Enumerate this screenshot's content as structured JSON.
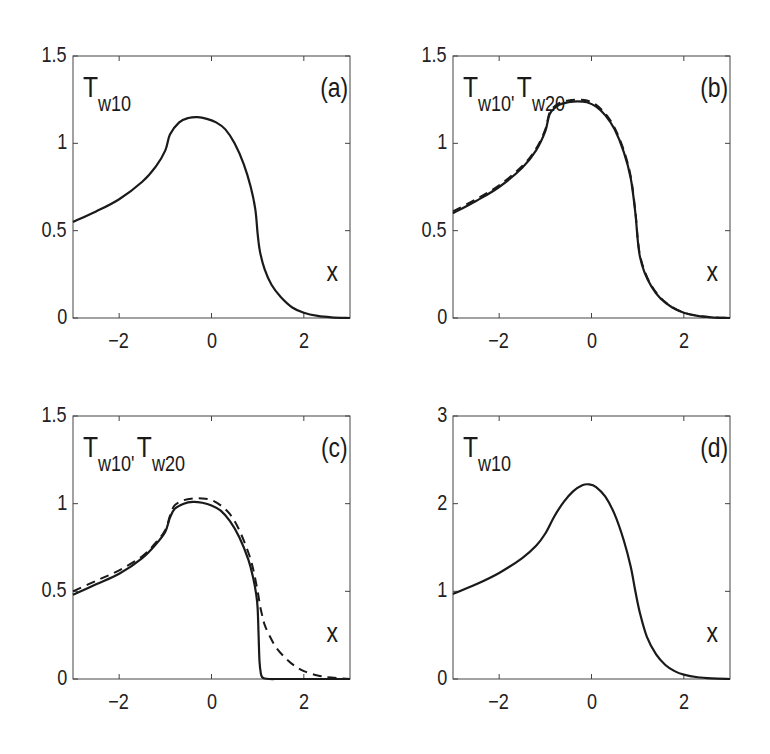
{
  "figure": {
    "panels": [
      {
        "id": "a",
        "panel_label": "(a)",
        "ylabel_parts": [
          {
            "T": "T",
            "sub": "w10"
          }
        ],
        "xlabel": "x"
      },
      {
        "id": "b",
        "panel_label": "(b)",
        "ylabel_parts": [
          {
            "T": "T",
            "sub": "w10'"
          },
          {
            "T": "T",
            "sub": "w20"
          }
        ],
        "xlabel": "x"
      },
      {
        "id": "c",
        "panel_label": "(c)",
        "ylabel_parts": [
          {
            "T": "T",
            "sub": "w10'"
          },
          {
            "T": "T",
            "sub": "w20"
          }
        ],
        "xlabel": "x"
      },
      {
        "id": "d",
        "panel_label": "(d)",
        "ylabel_parts": [
          {
            "T": "T",
            "sub": "w10"
          }
        ],
        "xlabel": "x"
      }
    ]
  },
  "chart_data": [
    {
      "type": "line",
      "title": "(a)",
      "xlabel": "x",
      "ylabel": "T_w10",
      "xlim": [
        -3,
        3
      ],
      "ylim": [
        0,
        1.5
      ],
      "xticks": [
        -2,
        0,
        2
      ],
      "yticks": [
        0,
        0.5,
        1,
        1.5
      ],
      "ytick_labels": [
        "0",
        "0.5",
        "1",
        "1.5"
      ],
      "grid": false,
      "box": {
        "left": 73,
        "top": 56,
        "right": 350,
        "bottom": 318
      },
      "series": [
        {
          "name": "T_w10",
          "style": "solid",
          "x": [
            -3,
            -2.5,
            -2,
            -1.5,
            -1.2,
            -1.0,
            -0.9,
            -0.7,
            -0.5,
            -0.3,
            -0.1,
            0.1,
            0.3,
            0.5,
            0.7,
            0.85,
            0.95,
            1.0,
            1.05,
            1.15,
            1.3,
            1.5,
            1.75,
            2.0,
            2.3,
            2.6,
            3.0
          ],
          "y": [
            0.55,
            0.61,
            0.68,
            0.78,
            0.87,
            0.96,
            1.05,
            1.12,
            1.145,
            1.15,
            1.14,
            1.12,
            1.08,
            1.0,
            0.88,
            0.75,
            0.62,
            0.48,
            0.38,
            0.28,
            0.19,
            0.12,
            0.06,
            0.03,
            0.012,
            0.004,
            0.0
          ]
        }
      ]
    },
    {
      "type": "line",
      "title": "(b)",
      "xlabel": "x",
      "ylabel": "T_w10, T_w20",
      "xlim": [
        -3,
        3
      ],
      "ylim": [
        0,
        1.5
      ],
      "xticks": [
        -2,
        0,
        2
      ],
      "yticks": [
        0,
        0.5,
        1,
        1.5
      ],
      "ytick_labels": [
        "0",
        "0.5",
        "1",
        "1.5"
      ],
      "grid": false,
      "box": {
        "left": 453,
        "top": 56,
        "right": 730,
        "bottom": 318
      },
      "series": [
        {
          "name": "T_w10",
          "style": "solid",
          "x": [
            -3,
            -2.5,
            -2,
            -1.5,
            -1.2,
            -1.0,
            -0.9,
            -0.7,
            -0.5,
            -0.3,
            -0.1,
            0.1,
            0.3,
            0.5,
            0.7,
            0.85,
            0.95,
            1.0,
            1.05,
            1.15,
            1.3,
            1.5,
            1.75,
            2.0,
            2.3,
            2.6,
            3.0
          ],
          "y": [
            0.6,
            0.67,
            0.75,
            0.86,
            0.96,
            1.07,
            1.17,
            1.22,
            1.235,
            1.24,
            1.235,
            1.21,
            1.16,
            1.08,
            0.95,
            0.8,
            0.6,
            0.45,
            0.35,
            0.26,
            0.18,
            0.11,
            0.06,
            0.03,
            0.012,
            0.004,
            0.0
          ]
        },
        {
          "name": "T_w20",
          "style": "dashed",
          "x": [
            -3,
            -2.5,
            -2,
            -1.5,
            -1.2,
            -1.0,
            -0.9,
            -0.7,
            -0.5,
            -0.3,
            -0.1,
            0.1,
            0.3,
            0.5,
            0.7,
            0.85,
            0.95,
            1.0,
            1.05,
            1.15,
            1.3,
            1.5,
            1.75,
            2.0,
            2.3,
            2.6,
            3.0
          ],
          "y": [
            0.61,
            0.68,
            0.76,
            0.87,
            0.97,
            1.08,
            1.18,
            1.23,
            1.245,
            1.25,
            1.245,
            1.22,
            1.17,
            1.09,
            0.96,
            0.81,
            0.61,
            0.46,
            0.36,
            0.27,
            0.185,
            0.115,
            0.062,
            0.031,
            0.013,
            0.004,
            0.0
          ]
        }
      ]
    },
    {
      "type": "line",
      "title": "(c)",
      "xlabel": "x",
      "ylabel": "T_w10, T_w20",
      "xlim": [
        -3,
        3
      ],
      "ylim": [
        0,
        1.5
      ],
      "xticks": [
        -2,
        0,
        2
      ],
      "yticks": [
        0,
        0.5,
        1,
        1.5
      ],
      "ytick_labels": [
        "0",
        "0.5",
        "1",
        "1.5"
      ],
      "grid": false,
      "box": {
        "left": 73,
        "top": 416,
        "right": 350,
        "bottom": 679
      },
      "series": [
        {
          "name": "T_w10",
          "style": "solid",
          "x": [
            -3,
            -2.5,
            -2,
            -1.5,
            -1.2,
            -1.0,
            -0.9,
            -0.8,
            -0.6,
            -0.4,
            -0.2,
            0.0,
            0.2,
            0.4,
            0.6,
            0.8,
            0.9,
            0.97,
            1.0,
            1.02,
            1.04,
            1.07,
            1.1,
            1.15,
            1.25,
            1.5,
            2.0,
            3.0
          ],
          "y": [
            0.48,
            0.54,
            0.6,
            0.69,
            0.77,
            0.84,
            0.92,
            0.97,
            1.0,
            1.01,
            1.005,
            0.99,
            0.96,
            0.9,
            0.81,
            0.68,
            0.58,
            0.48,
            0.4,
            0.25,
            0.1,
            0.03,
            0.01,
            0.003,
            0.0,
            0.0,
            0.0,
            0.0
          ]
        },
        {
          "name": "T_w20",
          "style": "dashed",
          "x": [
            -3,
            -2.5,
            -2,
            -1.5,
            -1.2,
            -1.0,
            -0.9,
            -0.8,
            -0.6,
            -0.4,
            -0.2,
            0.0,
            0.2,
            0.4,
            0.6,
            0.8,
            0.9,
            1.0,
            1.05,
            1.1,
            1.15,
            1.25,
            1.4,
            1.6,
            1.8,
            2.0,
            2.3,
            2.6,
            3.0
          ],
          "y": [
            0.5,
            0.56,
            0.62,
            0.7,
            0.78,
            0.85,
            0.93,
            0.99,
            1.02,
            1.03,
            1.03,
            1.02,
            0.99,
            0.94,
            0.85,
            0.72,
            0.63,
            0.5,
            0.42,
            0.36,
            0.31,
            0.25,
            0.18,
            0.12,
            0.075,
            0.045,
            0.02,
            0.008,
            0.0
          ]
        }
      ]
    },
    {
      "type": "line",
      "title": "(d)",
      "xlabel": "x",
      "ylabel": "T_w10",
      "xlim": [
        -3,
        3
      ],
      "ylim": [
        0,
        3
      ],
      "xticks": [
        -2,
        0,
        2
      ],
      "yticks": [
        0,
        1,
        2,
        3
      ],
      "ytick_labels": [
        "0",
        "1",
        "2",
        "3"
      ],
      "grid": false,
      "box": {
        "left": 453,
        "top": 416,
        "right": 730,
        "bottom": 679
      },
      "series": [
        {
          "name": "T_w10",
          "style": "solid",
          "x": [
            -3,
            -2.5,
            -2,
            -1.5,
            -1.2,
            -1.0,
            -0.8,
            -0.6,
            -0.4,
            -0.2,
            -0.05,
            0.1,
            0.3,
            0.5,
            0.7,
            0.85,
            0.95,
            1.05,
            1.2,
            1.4,
            1.6,
            1.8,
            2.0,
            2.3,
            2.6,
            3.0
          ],
          "y": [
            0.97,
            1.08,
            1.21,
            1.38,
            1.52,
            1.66,
            1.86,
            2.02,
            2.14,
            2.21,
            2.22,
            2.19,
            2.08,
            1.88,
            1.58,
            1.28,
            1.0,
            0.75,
            0.48,
            0.28,
            0.16,
            0.09,
            0.05,
            0.02,
            0.007,
            0.0
          ]
        }
      ]
    }
  ]
}
